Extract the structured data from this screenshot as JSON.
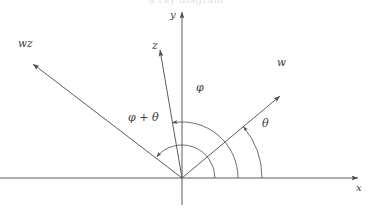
{
  "figure": {
    "kind": "vector-angle-diagram",
    "background_color": "#ffffff",
    "stroke_color": "#4a4a4a",
    "label_color": "#3a3a3a",
    "clipped_top_text": "a ray diagram"
  },
  "axes": {
    "x_label": "x",
    "y_label": "y",
    "origin": {
      "x": 182,
      "y": 178
    }
  },
  "rays": [
    {
      "id": "wz",
      "label": "wz",
      "angle_deg": 140,
      "label_x": 18,
      "label_y": 38
    },
    {
      "id": "z",
      "label": "z",
      "angle_deg": 100,
      "label_x": 152,
      "label_y": 40
    },
    {
      "id": "w",
      "label": "w",
      "angle_deg": 40,
      "label_x": 277,
      "label_y": 57
    }
  ],
  "angles": [
    {
      "id": "theta",
      "label": "θ",
      "from_deg": 0,
      "to_deg": 40,
      "radius": 80,
      "label_x": 262,
      "label_y": 118
    },
    {
      "id": "phi",
      "label": "φ",
      "from_deg": 0,
      "to_deg": 100,
      "radius": 56,
      "label_x": 196,
      "label_y": 82
    },
    {
      "id": "phi_plus_theta",
      "label": "φ + θ",
      "from_deg": 0,
      "to_deg": 140,
      "radius": 33,
      "label_x": 128,
      "label_y": 112
    }
  ]
}
